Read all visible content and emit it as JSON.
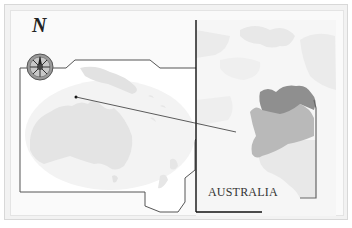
{
  "map": {
    "north_label": "N",
    "region_label": "AUSTRALIA",
    "icons": {
      "compass": "compass-rose-icon"
    },
    "colors": {
      "frame_bg": "#f2f2f2",
      "land_light": "#e6e6e6",
      "land_mid": "#b8b8b8",
      "land_dark": "#8e8e8e",
      "border_line": "#333333"
    },
    "overview": {
      "title": "Oceania overview map",
      "regions": [
        "Australia",
        "New Guinea",
        "New Zealand",
        "Tasmania"
      ]
    },
    "detail": {
      "title": "Northern Territory detail map",
      "highlighted_regions": [
        "Top End",
        "Central region"
      ]
    }
  }
}
